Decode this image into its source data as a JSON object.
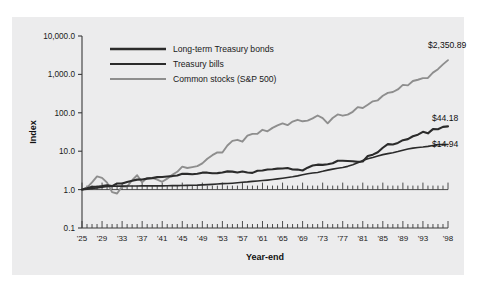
{
  "chart_data": {
    "type": "line",
    "title": "",
    "xlabel": "Year-end",
    "ylabel": "Index",
    "yscale": "log",
    "ylim": [
      0.1,
      10000
    ],
    "xlim": [
      1925,
      1998
    ],
    "grid": false,
    "legend_position": "top-left",
    "ytick_labels": [
      "10,000.0",
      "1,000.0",
      "100.0",
      "10.0",
      "1.0",
      "0.1"
    ],
    "ytick_values": [
      10000,
      1000,
      100,
      10,
      1,
      0.1
    ],
    "xtick_labels": [
      "'25",
      "'29",
      "'33",
      "'37",
      "'41",
      "'45",
      "'49",
      "'53",
      "'57",
      "'61",
      "'65",
      "'69",
      "'73",
      "'77",
      "'81",
      "'85",
      "'89",
      "'93",
      "'98"
    ],
    "xtick_values": [
      1925,
      1929,
      1933,
      1937,
      1941,
      1945,
      1949,
      1953,
      1957,
      1961,
      1965,
      1969,
      1973,
      1977,
      1981,
      1985,
      1989,
      1993,
      1998
    ],
    "x": [
      1925,
      1926,
      1927,
      1928,
      1929,
      1930,
      1931,
      1932,
      1933,
      1934,
      1935,
      1936,
      1937,
      1938,
      1939,
      1940,
      1941,
      1942,
      1943,
      1944,
      1945,
      1946,
      1947,
      1948,
      1949,
      1950,
      1951,
      1952,
      1953,
      1954,
      1955,
      1956,
      1957,
      1958,
      1959,
      1960,
      1961,
      1962,
      1963,
      1964,
      1965,
      1966,
      1967,
      1968,
      1969,
      1970,
      1971,
      1972,
      1973,
      1974,
      1975,
      1976,
      1977,
      1978,
      1979,
      1980,
      1981,
      1982,
      1983,
      1984,
      1985,
      1986,
      1987,
      1988,
      1989,
      1990,
      1991,
      1992,
      1993,
      1994,
      1995,
      1996,
      1997,
      1998
    ],
    "series": [
      {
        "name": "Common stocks (S&P 500)",
        "color": "#8e8e8e",
        "width": 1.9,
        "end_label": "$2,350.89",
        "end_value": 2350.89,
        "values": [
          1.0,
          1.12,
          1.54,
          2.2,
          2.02,
          1.52,
          0.86,
          0.79,
          1.21,
          1.2,
          1.77,
          2.37,
          1.54,
          2.02,
          2.01,
          1.81,
          1.6,
          1.93,
          2.43,
          2.91,
          3.97,
          3.65,
          3.85,
          4.07,
          4.83,
          6.36,
          7.89,
          9.34,
          9.24,
          14.11,
          18.56,
          19.78,
          17.65,
          25.3,
          28.32,
          28.46,
          36.11,
          32.95,
          40.47,
          47.13,
          53.01,
          47.67,
          59.1,
          65.64,
          60.06,
          62.47,
          71.41,
          84.96,
          72.5,
          53.31,
          73.14,
          90.58,
          84.08,
          89.59,
          106.11,
          140.51,
          133.61,
          162.38,
          199.0,
          211.44,
          278.47,
          330.24,
          347.58,
          405.14,
          533.37,
          516.76,
          674.17,
          725.8,
          798.63,
          809.04,
          1113.09,
          1368.1,
          1824.32,
          2350.89
        ]
      },
      {
        "name": "Long-term Treasury bonds",
        "color": "#2b2b2b",
        "width": 2.1,
        "end_label": "$44.18",
        "end_value": 44.18,
        "values": [
          1.0,
          1.08,
          1.18,
          1.19,
          1.23,
          1.29,
          1.23,
          1.44,
          1.44,
          1.58,
          1.69,
          1.82,
          1.83,
          1.93,
          1.99,
          2.11,
          2.13,
          2.2,
          2.25,
          2.32,
          2.57,
          2.57,
          2.5,
          2.59,
          2.76,
          2.76,
          2.66,
          2.69,
          2.78,
          2.98,
          2.94,
          2.78,
          2.97,
          2.79,
          2.73,
          3.1,
          3.13,
          3.35,
          3.39,
          3.51,
          3.54,
          3.66,
          3.33,
          3.32,
          3.15,
          3.72,
          4.22,
          4.46,
          4.41,
          4.59,
          4.84,
          5.65,
          5.62,
          5.55,
          5.49,
          5.28,
          5.39,
          7.51,
          8.13,
          9.41,
          12.31,
          15.28,
          14.91,
          16.41,
          19.35,
          20.6,
          24.56,
          27.01,
          32.03,
          29.17,
          37.61,
          37.34,
          43.1,
          44.18
        ]
      },
      {
        "name": "Treasury bills",
        "color": "#2b2b2b",
        "width": 1.6,
        "end_label": "$14.94",
        "end_value": 14.94,
        "values": [
          1.0,
          1.03,
          1.07,
          1.11,
          1.16,
          1.21,
          1.22,
          1.23,
          1.23,
          1.24,
          1.24,
          1.24,
          1.25,
          1.25,
          1.25,
          1.25,
          1.25,
          1.26,
          1.27,
          1.27,
          1.28,
          1.29,
          1.3,
          1.31,
          1.33,
          1.35,
          1.37,
          1.4,
          1.43,
          1.44,
          1.47,
          1.51,
          1.56,
          1.59,
          1.64,
          1.68,
          1.72,
          1.77,
          1.83,
          1.9,
          1.98,
          2.07,
          2.16,
          2.28,
          2.43,
          2.59,
          2.7,
          2.8,
          2.99,
          3.22,
          3.41,
          3.58,
          3.76,
          4.03,
          4.45,
          4.97,
          5.71,
          6.32,
          6.87,
          7.54,
          8.13,
          8.65,
          9.12,
          9.77,
          10.59,
          11.41,
          12.04,
          12.47,
          12.86,
          13.35,
          14.09,
          14.82,
          15.0,
          14.94
        ]
      }
    ],
    "annotations": [
      {
        "text": "$2,350.89",
        "value": 2350.89
      },
      {
        "text": "$44.18",
        "value": 44.18
      },
      {
        "text": "$14.94",
        "value": 14.94
      }
    ]
  },
  "legend": {
    "items": [
      {
        "label": "Long-term Treasury bonds",
        "color": "#2b2b2b"
      },
      {
        "label": "Treasury bills",
        "color": "#2b2b2b"
      },
      {
        "label": "Common stocks (S&P 500)",
        "color": "#8e8e8e"
      }
    ]
  }
}
